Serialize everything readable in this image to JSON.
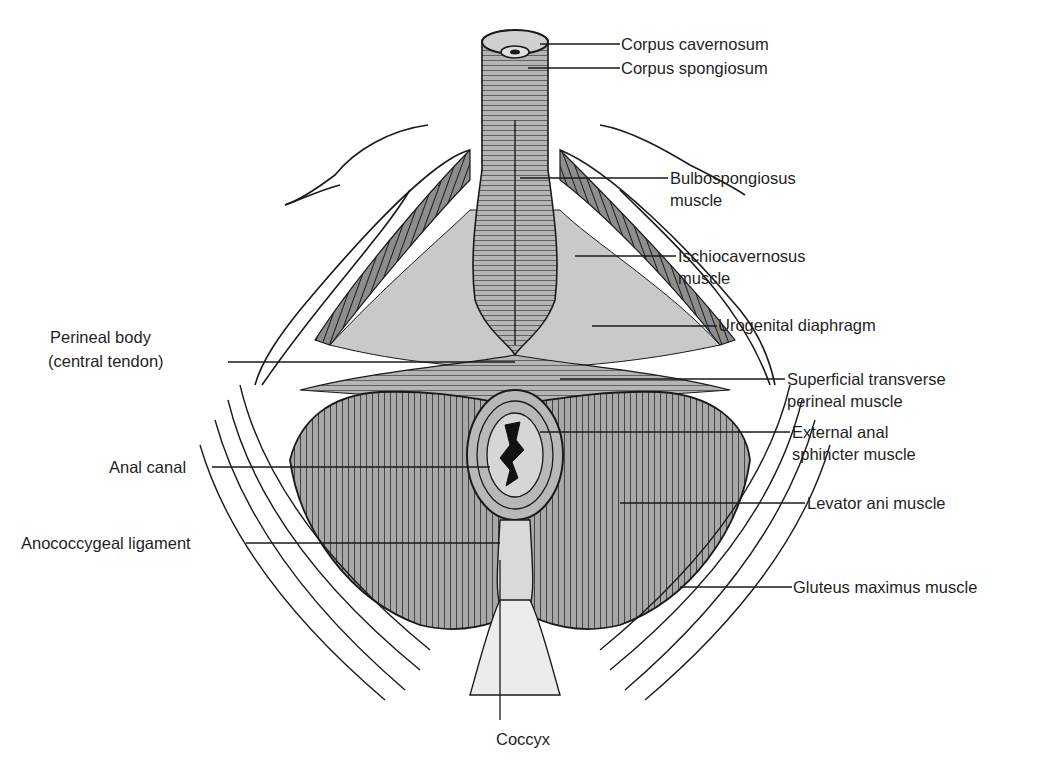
{
  "figure": {
    "colors": {
      "ink": "#1a1a1a",
      "muscle_fill": "#9a9a9a",
      "dark_fill": "#5a5a5a",
      "light_fill": "#d4d4d4",
      "background": "#ffffff"
    }
  },
  "labels": {
    "corpus_cavernosum": "Corpus cavernosum",
    "corpus_spongiosum": "Corpus spongiosum",
    "bulbospongiosus_1": "Bulbospongiosus",
    "bulbospongiosus_2": "muscle",
    "ischiocavernosus_1": "Ischiocavernosus",
    "ischiocavernosus_2": "muscle",
    "perineal_body_1": "Perineal body",
    "perineal_body_2": "(central tendon)",
    "urogenital_diaphragm": "Urogenital diaphragm",
    "superficial_transverse_1": "Superficial transverse",
    "superficial_transverse_2": "perineal muscle",
    "external_anal_1": "External anal",
    "external_anal_2": "sphincter muscle",
    "anal_canal": "Anal canal",
    "levator_ani": "Levator ani muscle",
    "anococcygeal": "Anococcygeal ligament",
    "gluteus_maximus": "Gluteus maximus muscle",
    "coccyx": "Coccyx"
  }
}
